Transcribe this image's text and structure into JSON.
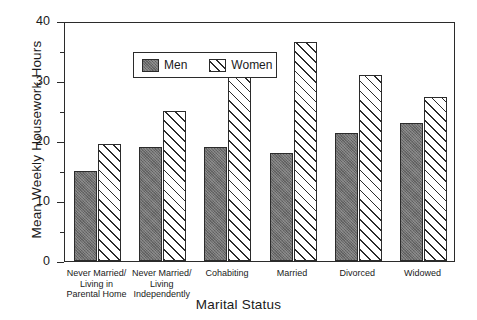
{
  "chart_data": {
    "type": "bar",
    "title": "",
    "xlabel": "Marital Status",
    "ylabel": "Mean Weekly Housework Hours",
    "categories": [
      "Never Married/\nLiving in\nParental Home",
      "Never Married/\nLiving\nIndependently",
      "Cohabiting",
      "Married",
      "Divorced",
      "Widowed"
    ],
    "category_lines": [
      [
        "Never Married/",
        "Living in",
        "Parental Home"
      ],
      [
        "Never Married/",
        "Living",
        "Independently"
      ],
      [
        "Cohabiting"
      ],
      [
        "Married"
      ],
      [
        "Divorced"
      ],
      [
        "Widowed"
      ]
    ],
    "series": [
      {
        "name": "Men",
        "values": [
          15,
          19,
          19,
          18,
          21.3,
          23
        ]
      },
      {
        "name": "Women",
        "values": [
          19.5,
          25,
          31,
          36.5,
          31,
          27.3
        ]
      }
    ],
    "ylim": [
      0,
      40
    ],
    "yticks": [
      0,
      10,
      20,
      30,
      40
    ],
    "ytick_labels": [
      "0",
      "10",
      "20",
      "30",
      "40"
    ],
    "yminor_ticks": [
      5,
      15,
      25,
      35
    ],
    "grid": false,
    "legend_position": "upper left",
    "colors": {
      "men_fill": "#6e6e6e",
      "women_fill": "#ffffff",
      "outline": "#2b2b2b",
      "hatch": "#2b2b2b",
      "background": "#ffffff"
    }
  },
  "legend": {
    "entries": [
      {
        "label": "Men",
        "pattern": "solid-gray"
      },
      {
        "label": "Women",
        "pattern": "diagonal-hatch"
      }
    ]
  }
}
